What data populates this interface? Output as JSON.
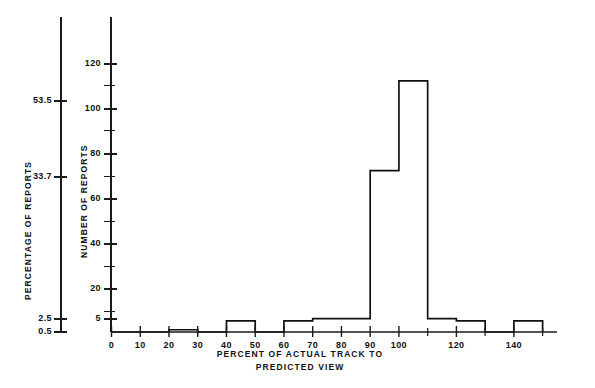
{
  "chart_data": {
    "type": "bar",
    "title": "",
    "subtitle": "",
    "xlabel": "PERCENT OF ACTUAL TRACK TO",
    "xlabel_line2": "PREDICTED VIEW",
    "ylabel_left": "PERCENTAGE OF REPORTS",
    "ylabel_right": "NUMBER OF REPORTS",
    "grid": false,
    "legend": "none",
    "xlim": [
      0,
      155
    ],
    "ylim": [
      0,
      128
    ],
    "bin_width": 10,
    "x_tick_labels": [
      "0",
      "10",
      "20",
      "30",
      "40",
      "50",
      "60",
      "70",
      "80",
      "90",
      "100",
      "120",
      "140"
    ],
    "x_tick_values": [
      0,
      10,
      20,
      30,
      40,
      50,
      60,
      70,
      80,
      90,
      100,
      120,
      140
    ],
    "x_minor_ticks": [
      110,
      130,
      150
    ],
    "y_tick_labels_right": [
      "0",
      "5",
      "20",
      "40",
      "60",
      "80",
      "100",
      "120"
    ],
    "y_tick_values_right": [
      0,
      5,
      20,
      40,
      60,
      80,
      100,
      120
    ],
    "y_minor_ticks_right": [
      10,
      30,
      50,
      70,
      90,
      110
    ],
    "y_tick_labels_left": [
      "0.5",
      "2.5",
      "33.7",
      "53.5"
    ],
    "y_tick_values_left_as_count": [
      1,
      5,
      67.5,
      107
    ],
    "categories": [
      "0-10",
      "10-20",
      "20-30",
      "30-40",
      "40-50",
      "50-60",
      "60-70",
      "70-80",
      "80-90",
      "90-100",
      "100-110",
      "110-120",
      "120-130",
      "130-140",
      "140-150"
    ],
    "bin_starts": [
      0,
      10,
      20,
      30,
      40,
      50,
      60,
      70,
      80,
      90,
      100,
      110,
      120,
      130,
      140
    ],
    "values": [
      0,
      0,
      1,
      0,
      5,
      0,
      5,
      6,
      6,
      72,
      112,
      6,
      5,
      0,
      5
    ],
    "axis_color": "#1a1a1a",
    "bar_color": "#ffffff",
    "bar_edge_color": "#111111"
  }
}
